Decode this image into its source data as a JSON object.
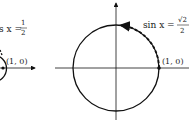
{
  "left_panel": {
    "equation_prefix": "s x =",
    "fraction_num": "1",
    "fraction_den": "2",
    "point_label": "(1, 0)"
  },
  "right_panel": {
    "equation_prefix": "sin x =",
    "fraction_num": "√2",
    "fraction_den": "2",
    "point_label": "(1, 0)"
  }
}
